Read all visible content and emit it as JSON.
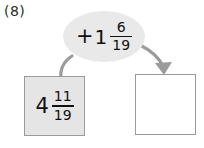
{
  "problem": {
    "number_label": "(8)",
    "start_value": {
      "sign": "",
      "whole": "4",
      "numerator": "11",
      "denominator": "19"
    },
    "operation": {
      "sign": "+",
      "whole": "1",
      "numerator": "6",
      "denominator": "19"
    },
    "answer": {
      "value": ""
    }
  },
  "arrows": {
    "input_arrow_name": "input-curve",
    "output_arrow_name": "output-arrow",
    "color": "#9b9b9b"
  },
  "colors": {
    "box_fill": "#e5e5e5",
    "box_border": "#9a9a9a",
    "bubble_fill": "#e9e9e9",
    "ink": "#111111",
    "arrow": "#9b9b9b",
    "background": "#ffffff"
  }
}
